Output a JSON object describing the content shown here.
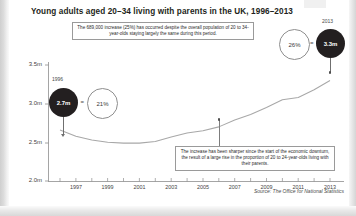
{
  "title": "Young adults aged 20–34 living with parents in the UK, 1996–2013",
  "annotations": {
    "top": "The 689,000 increase (25%) has occurred despite the overall population of 20 to 34-year-olds staying largely the same during this period.",
    "bottom": "The increase has been sharper since the start of the economic downturn, the result of a large rise in the proportion of 20 to 24-year-olds living with their parents."
  },
  "callouts": {
    "start": {
      "year_label": "1996",
      "value_label": "2.7m",
      "equals": "=",
      "share_label": "21%"
    },
    "end": {
      "year_label": "2013",
      "value_label": "3.3m",
      "equals": "=",
      "share_label": "26%"
    }
  },
  "source": "Source: The Office for National Statistics",
  "colors": {
    "ink": "#231f20",
    "line": "#9a9a9a",
    "axis": "#8e8e8e",
    "bubble_dark": "#231f20",
    "background": "#ffffff"
  },
  "chart_data": {
    "type": "line",
    "title": "Young adults aged 20–34 living with parents in the UK, 1996–2013",
    "xlabel": "",
    "ylabel": "",
    "grid": false,
    "legend": "none",
    "ylim": [
      2.0,
      3.5
    ],
    "ytick_labels": [
      "3.5m",
      "3.0m",
      "2.5m",
      "2.0m"
    ],
    "ytick_values": [
      3.5,
      3.0,
      2.5,
      2.0
    ],
    "xtick_labels": [
      "1997",
      "1999",
      "2001",
      "2003",
      "2005",
      "2007",
      "2009",
      "2011",
      "2013"
    ],
    "xtick_values": [
      1997,
      1999,
      2001,
      2003,
      2005,
      2007,
      2009,
      2011,
      2013
    ],
    "x": [
      1996,
      1997,
      1998,
      1999,
      2000,
      2001,
      2002,
      2003,
      2004,
      2005,
      2006,
      2007,
      2008,
      2009,
      2010,
      2011,
      2012,
      2013
    ],
    "series": [
      {
        "name": "Young adults aged 20-34 living with parents (millions)",
        "values": [
          2.66,
          2.58,
          2.53,
          2.5,
          2.49,
          2.49,
          2.51,
          2.57,
          2.62,
          2.65,
          2.7,
          2.79,
          2.86,
          2.95,
          3.05,
          3.08,
          3.18,
          3.3
        ],
        "unit": "millions"
      }
    ],
    "callout_points": [
      {
        "x": 1996,
        "y": 2.7,
        "label": "2.7m",
        "share": "21%"
      },
      {
        "x": 2013,
        "y": 3.3,
        "label": "3.3m",
        "share": "26%"
      }
    ]
  }
}
